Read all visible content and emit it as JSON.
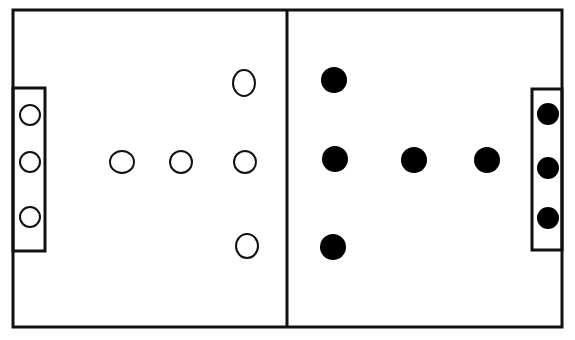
{
  "diagram": {
    "type": "field-formation",
    "colors": {
      "line": "#111111",
      "background": "#ffffff",
      "team_open_fill": "#ffffff",
      "team_filled_fill": "#000000"
    },
    "field": {
      "x": 13,
      "y": 10,
      "width": 549,
      "height": 317,
      "midline_x": 287
    },
    "goal_boxes": [
      {
        "side": "left",
        "x": 13,
        "y": 88,
        "width": 32,
        "height": 163
      },
      {
        "side": "right",
        "x": 532,
        "y": 89,
        "width": 30,
        "height": 161
      }
    ],
    "teams": [
      {
        "name": "open-circles",
        "style": "outline",
        "players": [
          {
            "x": 30,
            "y": 115,
            "rx": 11,
            "ry": 11
          },
          {
            "x": 30,
            "y": 162,
            "rx": 11,
            "ry": 11
          },
          {
            "x": 30,
            "y": 217,
            "rx": 11,
            "ry": 11
          },
          {
            "x": 122,
            "y": 162,
            "rx": 13,
            "ry": 12
          },
          {
            "x": 181,
            "y": 162,
            "rx": 12,
            "ry": 12
          },
          {
            "x": 245,
            "y": 162,
            "rx": 12,
            "ry": 12
          },
          {
            "x": 244,
            "y": 83,
            "rx": 12,
            "ry": 14
          },
          {
            "x": 247,
            "y": 246,
            "rx": 12,
            "ry": 13
          }
        ]
      },
      {
        "name": "filled-circles",
        "style": "filled",
        "players": [
          {
            "x": 334,
            "y": 80,
            "rx": 13,
            "ry": 13
          },
          {
            "x": 335,
            "y": 159,
            "rx": 13,
            "ry": 13
          },
          {
            "x": 414,
            "y": 160,
            "rx": 13,
            "ry": 13
          },
          {
            "x": 487,
            "y": 160,
            "rx": 13,
            "ry": 13
          },
          {
            "x": 333,
            "y": 247,
            "rx": 13,
            "ry": 13
          },
          {
            "x": 548,
            "y": 114,
            "rx": 11,
            "ry": 11
          },
          {
            "x": 548,
            "y": 168,
            "rx": 11,
            "ry": 11
          },
          {
            "x": 548,
            "y": 218,
            "rx": 11,
            "ry": 11
          }
        ]
      }
    ]
  }
}
